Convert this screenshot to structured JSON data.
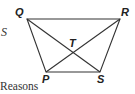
{
  "diagram": {
    "type": "trapezoid-with-diagonals",
    "points": {
      "Q": {
        "label": "Q",
        "x": 27,
        "y": 19
      },
      "R": {
        "label": "R",
        "x": 120,
        "y": 19
      },
      "S": {
        "label": "S",
        "x": 100,
        "y": 72
      },
      "P": {
        "label": "P",
        "x": 46,
        "y": 72
      },
      "T": {
        "label": "T",
        "x": 74,
        "y": 52
      }
    },
    "segments": [
      "QR",
      "RS",
      "SP",
      "PQ",
      "QS",
      "RP"
    ]
  },
  "text": {
    "stray_left": "S",
    "reasons_heading": "Reasons"
  }
}
